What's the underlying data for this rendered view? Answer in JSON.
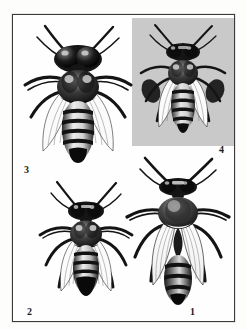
{
  "plate": {
    "kind": "engraved-natural-history-plate",
    "subject": "honey bee castes",
    "background_color": "#fdfdfc",
    "frame_color": "#3a3a3a",
    "inset_panel_color": "#c9c9c9"
  },
  "figures": [
    {
      "number": "1",
      "position": "bottom-right",
      "caste": "queen",
      "on_inset_panel": false
    },
    {
      "number": "2",
      "position": "bottom-left",
      "caste": "worker",
      "on_inset_panel": false
    },
    {
      "number": "3",
      "position": "top-left",
      "caste": "drone",
      "on_inset_panel": false
    },
    {
      "number": "4",
      "position": "top-right",
      "caste": "worker",
      "on_inset_panel": true
    }
  ],
  "labels": {
    "one": "1",
    "two": "2",
    "three": "3",
    "four": "4"
  }
}
